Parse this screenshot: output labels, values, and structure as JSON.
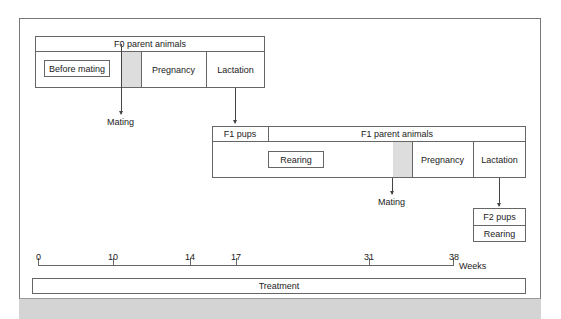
{
  "f0": {
    "header": "F0 parent animals",
    "before_mating": "Before mating",
    "pregnancy": "Pregnancy",
    "lactation": "Lactation",
    "mating": "Mating"
  },
  "f1": {
    "pups": "F1 pups",
    "header": "F1 parent animals",
    "rearing": "Rearing",
    "pregnancy": "Pregnancy",
    "lactation": "Lactation",
    "mating": "Mating"
  },
  "f2": {
    "pups": "F2 pups",
    "rearing": "Rearing"
  },
  "axis": {
    "ticks": [
      "0",
      "10",
      "14",
      "17",
      "31",
      "38"
    ],
    "unit": "Weeks"
  },
  "treatment": "Treatment",
  "colors": {
    "line": "#666666",
    "shade": "#dddddd"
  }
}
